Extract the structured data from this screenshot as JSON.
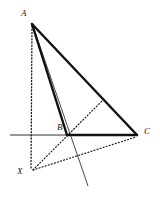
{
  "figure": {
    "kind": "geometry-diagram",
    "width": 160,
    "height": 204,
    "background_color": "#ffffff",
    "stroke_color": "#1a1a1a",
    "points": {
      "A": {
        "label": "A",
        "x": 32,
        "y": 23,
        "label_x": 21,
        "label_y": 9
      },
      "B": {
        "label": "B",
        "x": 67,
        "y": 135,
        "label_x": 57,
        "label_y": 123
      },
      "C": {
        "label": "C",
        "x": 137,
        "y": 135,
        "label_x": 144,
        "label_y": 127
      },
      "X": {
        "label": "X",
        "x": 31,
        "y": 171,
        "label_x": 17,
        "label_y": 167
      }
    },
    "segments": [
      {
        "name": "segment-AB",
        "from": "A",
        "to": "B",
        "style": "solid",
        "weight": "thick"
      },
      {
        "name": "segment-AC",
        "from": "A",
        "to": "C",
        "style": "solid",
        "weight": "thick"
      },
      {
        "name": "segment-BC",
        "from": "B",
        "to": "C",
        "style": "solid",
        "weight": "thick"
      },
      {
        "name": "segment-AX",
        "from": "A",
        "to": "X",
        "style": "dotted",
        "weight": "thin"
      },
      {
        "name": "segment-XC",
        "from": "X",
        "to": "C",
        "style": "dotted",
        "weight": "thin"
      },
      {
        "name": "segment-X-to-AC",
        "from": "X",
        "to": "P",
        "style": "dotted",
        "weight": "thin"
      }
    ],
    "lines": [
      {
        "name": "horizontal-axis-line",
        "x1": 10,
        "y1": 135,
        "x2": 137,
        "y2": 135,
        "style": "solid",
        "weight": "thin"
      },
      {
        "name": "cevian-extension-line",
        "x1": 32,
        "y1": 23,
        "x2": 88,
        "y2": 186,
        "style": "solid",
        "weight": "thin"
      }
    ],
    "aux_points": {
      "P": {
        "x": 105,
        "y": 98
      }
    }
  }
}
